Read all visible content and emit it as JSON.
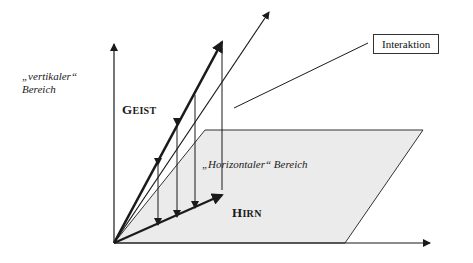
{
  "labels": {
    "vertical_region": [
      "„vertikaler“",
      "Bereich"
    ],
    "horizontal_region": "„Horizontaler“ Bereich",
    "mind": {
      "first": "G",
      "rest": "EIST"
    },
    "brain": {
      "first": "H",
      "rest": "IRN"
    },
    "interaction": "Interaktion"
  },
  "colors": {
    "plane_fill": "#ebebeb",
    "line": "#1a1a1a"
  }
}
